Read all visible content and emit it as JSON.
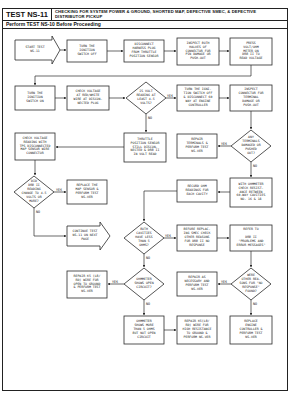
{
  "header": {
    "test_id": "TEST NS-11",
    "title": "CHECKING FOR SYSTEM POWER & GROUND, SHORTED MAP, DEFECTIVE SMEC, & DEFECTIVE DISTRIBUTOR PICKUP",
    "prerequisite": "Perform TEST NS-10 Before Proceeding"
  },
  "nodes": {
    "start": "START TEST\nNS-11",
    "ignition_off": "TURN THE\nIGNITION\nSWITCH OFF",
    "disconnect_tps": "DISCONNECT\nHARNESS PLUG\nFROM THROTTLE\nPOSITION SENSOR",
    "inspect_halves": "INSPECT BOTH\nHALVES OF\nCONNECTOR FOR\nPIN DAMAGE OR\nPUSH-OUT",
    "press_voltohm": "PRESS\nVOLT/OHM\nMETER ON\nDRB II TO\nREAD VOLTAGE",
    "ignition_on": "TURN THE\nIGNITION\nSWITCH ON",
    "check_voltage_plug": "CHECK VOLTAGE\nAT RED/WHITE\nWIRE AT DISCON-\nNECTED PLUG",
    "decision_4_5v": "IS VOLT\nREADING AT\nLEAST 4.5\nVOLTS?",
    "ignition_off_disconnect": "TURN THE IGNI-\nTION SWITCH OFF\n& DISCONNECT 60\nWAY AT ENGINE\nCONTROLLER",
    "inspect_terminal": "INSPECT\nCONNECTOR FOR\nTERMINAL\nDAMAGE OR\nPUSH-OUT",
    "check_map_voltage": "CHECK VOLTAGE\nREADING WITH\nTPS DISCONNECTED\nMAP SENSOR WIRE\nCONNECTOR",
    "tps_still_connected": "THROTTLE\nPOSITION SENSOR\nSTILL DISCON-\nNECTED & DRB II\nIN VOLT READ",
    "repair_terminals": "REPAIR\nTERMINALS &\nPERFORM TEST\nNS-VER",
    "decision_terminals": "ANY\nTERMINALS\nDAMAGED OR\nPUSHED\nOUT?",
    "decision_map_change": "DID\nDRB II\nREADING\nCHANGE TO 4.5\nVOLTS OR\nMORE?",
    "replace_map": "REPLACE THE\nMAP SENSOR &\nPERFORM TEST\nNS-VER",
    "record_ohm": "RECORD OHM\nREADINGS FOR\nEACH CAVITY",
    "ohmmeter_check": "WITH OHMMETER\nCHECK RESIST-\nANCE BETWEEN\n60-WAY CAVITIES\nNO. 16 & 18",
    "continue_test": "CONTINUE TEST\nNS-11 ON NEXT\nPAGE",
    "decision_cavities": "BOTH\nCAVITIES\nHAVE LESS\nTHAN 5\nOHMS?",
    "before_replacing": "BEFORE REPLAC-\nING SMEC CHECK\nOTHER REASONS\nFOR DRB II NO\nRESPONSE",
    "refer_to": "REFER TO\n\nDRB II\n\"PROBLEMS AND\nERROR MESSAGES\"",
    "repair_open": "REPAIR K5 (LB/\nRD) WIRE FOR\nOPEN TO GROUND\n& PERFORM TEST\nNS-VER",
    "decision_ohmmeter": "OHMMETER\nSHOWS OPEN\nCIRCUIT?",
    "repair_as_necessary": "REPAIR AS\nNECESSARY AND\nPERFORM TEST\nNS-VER",
    "decision_other_reasons": "WERE\nOTHER REA-\nSONS FOR \"NO\nRESPONSE\"\nFOUND?",
    "ohmmeter_more": "OHMMETER\nSHOWS MORE\nTHAN 5 OHMS\nBUT NOT OPEN\nCIRCUIT",
    "repair_resistance": "REPAIR K5(LB/\nRD) WIRE FOR\nHIGH RESISTANCE\nTO GROUND &\nPERFORM NS-VER",
    "replace_controller": "REPLACE\nENGINE\nCONTROLLER &\nPERFORM TEST\nNS-VER"
  },
  "labels": {
    "yes": "YES",
    "no": "NO"
  },
  "colors": {
    "line": "#2a2a2a",
    "paper": "#ffffff",
    "text": "#222222"
  }
}
